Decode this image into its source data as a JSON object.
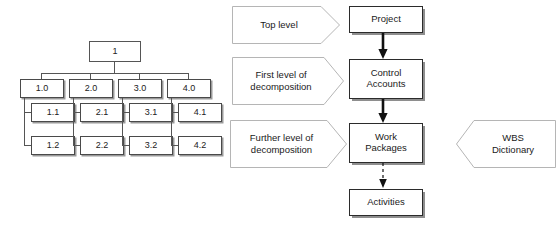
{
  "diagram": {
    "colors": {
      "background": "#ffffff",
      "box_border": "#2b2b2b",
      "tree_border": "#4a4a4a",
      "shadow": "#8e8e8e",
      "callout_border": "#b5b5b5",
      "arrow": "#111111",
      "text": "#1a1a1a"
    }
  },
  "wbs_tree": {
    "root": {
      "label": "1"
    },
    "columns": [
      {
        "parent": "1.0",
        "children": [
          "1.1",
          "1.2"
        ]
      },
      {
        "parent": "2.0",
        "children": [
          "2.1",
          "2.2"
        ]
      },
      {
        "parent": "3.0",
        "children": [
          "3.1",
          "3.2"
        ]
      },
      {
        "parent": "4.0",
        "children": [
          "4.1",
          "4.2"
        ]
      }
    ]
  },
  "flow": {
    "nodes": [
      {
        "id": "project",
        "label": "Project"
      },
      {
        "id": "control-accounts",
        "label": "Control\nAccounts",
        "line1": "Control",
        "line2": "Accounts"
      },
      {
        "id": "work-packages",
        "label": "Work\nPackages",
        "line1": "Work",
        "line2": "Packages"
      },
      {
        "id": "activities",
        "label": "Activities"
      }
    ],
    "connectors": [
      {
        "from": "project",
        "to": "control-accounts",
        "style": "solid"
      },
      {
        "from": "control-accounts",
        "to": "work-packages",
        "style": "solid"
      },
      {
        "from": "work-packages",
        "to": "activities",
        "style": "dashed"
      }
    ]
  },
  "callouts": {
    "left": [
      {
        "id": "top-level",
        "line1": "Top level",
        "line2": "",
        "direction": "right"
      },
      {
        "id": "first-level",
        "line1": "First level of",
        "line2": "decomposition",
        "direction": "right"
      },
      {
        "id": "further-level",
        "line1": "Further level of",
        "line2": "decomposition",
        "direction": "right"
      }
    ],
    "right": [
      {
        "id": "wbs-dictionary",
        "line1": "WBS",
        "line2": "Dictionary",
        "direction": "left"
      }
    ]
  }
}
